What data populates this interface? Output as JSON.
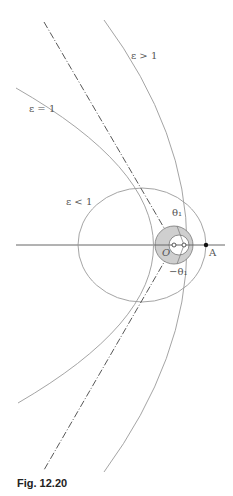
{
  "figure": {
    "caption": "Fig. 12.20",
    "labels": {
      "hyperbola": "ε > 1",
      "parabola": "ε = 1",
      "ellipse": "ε < 1",
      "theta_pos": "θ₁",
      "theta_neg": "−θ₁",
      "origin": "O",
      "apse": "A"
    },
    "colors": {
      "curve": "#9a9a9a",
      "axis": "#555555",
      "dashed": "#444444",
      "shade": "#c8c8c8"
    }
  }
}
